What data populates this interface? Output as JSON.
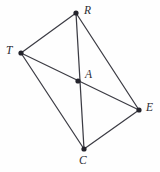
{
  "figure": {
    "kind": "geometry-diagram",
    "background_color": "#fefefe",
    "line_color": "#3c3c44",
    "vertex_color": "#24242c",
    "label_color": "#2c2c34",
    "width": 160,
    "height": 172,
    "vertices": [
      {
        "id": "R",
        "label": "R",
        "x": 76,
        "y": 13,
        "label_x": 84,
        "label_y": 5,
        "dot_r": 2.6
      },
      {
        "id": "T",
        "label": "T",
        "x": 21,
        "y": 53,
        "label_x": 6,
        "label_y": 45,
        "dot_r": 2.6
      },
      {
        "id": "A",
        "label": "A",
        "x": 78,
        "y": 81,
        "label_x": 85,
        "label_y": 69,
        "dot_r": 2.6
      },
      {
        "id": "E",
        "label": "E",
        "x": 139,
        "y": 110,
        "label_x": 146,
        "label_y": 102,
        "dot_r": 2.6
      },
      {
        "id": "C",
        "label": "C",
        "x": 84,
        "y": 149,
        "label_x": 79,
        "label_y": 155,
        "dot_r": 2.6
      }
    ],
    "edges": [
      {
        "id": "T-R",
        "from": "T",
        "to": "R"
      },
      {
        "id": "R-E",
        "from": "R",
        "to": "E"
      },
      {
        "id": "T-C",
        "from": "T",
        "to": "C"
      },
      {
        "id": "C-E",
        "from": "C",
        "to": "E"
      },
      {
        "id": "R-C",
        "from": "R",
        "to": "C"
      },
      {
        "id": "T-E",
        "from": "T",
        "to": "E"
      }
    ]
  }
}
